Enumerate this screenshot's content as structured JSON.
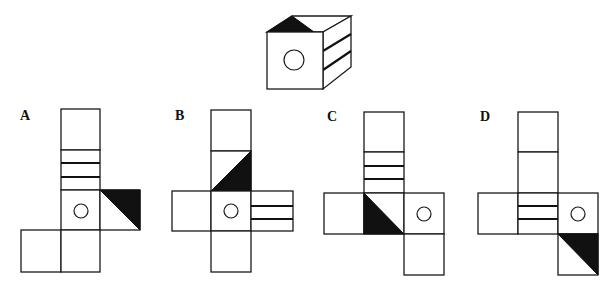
{
  "question": {
    "type": "cube-net-matching",
    "reference_cube": {
      "front_face": "circle",
      "top_face": "black-triangle",
      "right_face": "two-parallel-lines"
    }
  },
  "options": [
    {
      "label": "A"
    },
    {
      "label": "B"
    },
    {
      "label": "C"
    },
    {
      "label": "D"
    }
  ]
}
